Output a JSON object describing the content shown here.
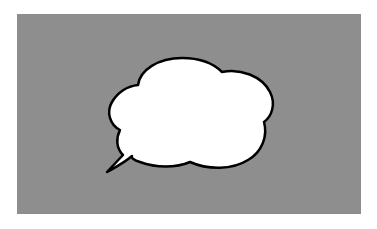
{
  "scene": {
    "background_color": "#ffffff",
    "panel_color": "#8e8e8e",
    "bubble": {
      "type": "thought-cloud-speech-bubble",
      "fill": "#ffffff",
      "stroke": "#000000",
      "text": ""
    }
  }
}
